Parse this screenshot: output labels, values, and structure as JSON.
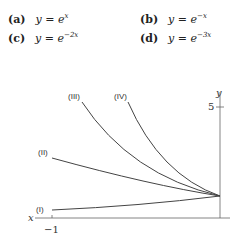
{
  "options": [
    {
      "label": "(a)",
      "lhs": "y = e",
      "exp": "x"
    },
    {
      "label": "(b)",
      "lhs": "y = e",
      "exp": "−x"
    },
    {
      "label": "(c)",
      "lhs": "y = e",
      "exp": "−2x"
    },
    {
      "label": "(d)",
      "lhs": "y = e",
      "exp": "−3x"
    }
  ],
  "graph": {
    "x_axis_label": "x",
    "y_axis_label": "y",
    "x_tick": "−1",
    "y_tick": "5",
    "curves": [
      {
        "label": "(I)"
      },
      {
        "label": "(II)"
      },
      {
        "label": "(III)"
      },
      {
        "label": "(IV)"
      }
    ]
  }
}
